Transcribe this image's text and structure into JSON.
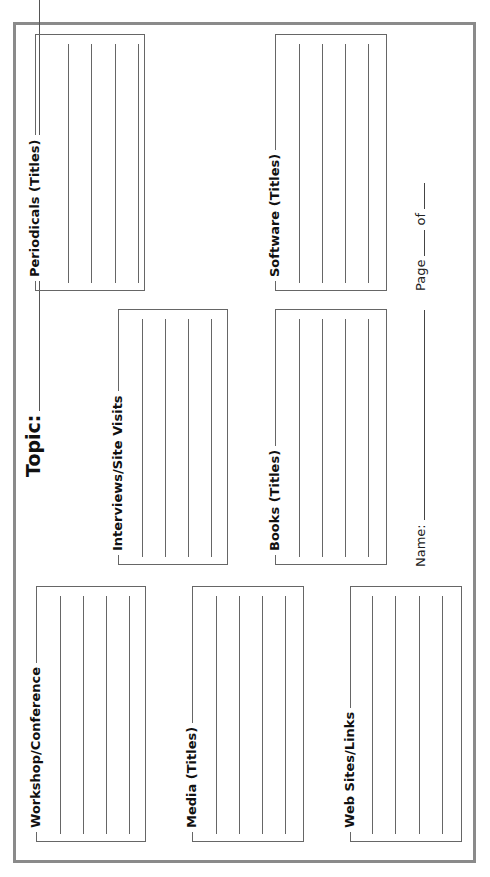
{
  "topic": {
    "label": "Topic:"
  },
  "sections": [
    {
      "id": "periodicals",
      "label": "Periodicals (Titles)",
      "lines": 4
    },
    {
      "id": "software",
      "label": "Software (Titles)",
      "lines": 4
    },
    {
      "id": "interviews",
      "label": "Interviews/Site Visits",
      "lines": 4
    },
    {
      "id": "books",
      "label": "Books (Titles)",
      "lines": 4
    },
    {
      "id": "workshop",
      "label": "Workshop/Conference",
      "lines": 4
    },
    {
      "id": "media",
      "label": "Media (Titles)",
      "lines": 4
    },
    {
      "id": "websites",
      "label": "Web Sites/Links",
      "lines": 3
    }
  ],
  "footer": {
    "name_label": "Name:",
    "page_label": "Page",
    "of_label": "of"
  }
}
